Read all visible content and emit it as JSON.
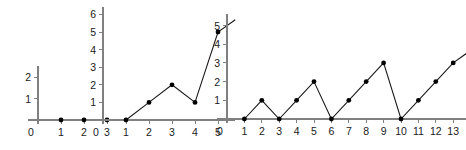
{
  "figure": {
    "background_color": "#ffffff",
    "axis_color": "#808080",
    "line_color": "#1a1a1a",
    "point_color": "#000000",
    "panel_count": 3
  },
  "chart_data": [
    {
      "type": "line",
      "name": "panel-1",
      "title": "",
      "xlabel": "",
      "ylabel": "",
      "x": [
        1,
        2,
        3
      ],
      "values": [
        0,
        0,
        0
      ],
      "xticks": [
        0,
        1,
        2,
        3
      ],
      "xtick_labels": [
        "0",
        "1",
        "2",
        "3"
      ],
      "yticks": [
        0,
        1,
        2
      ],
      "ytick_labels": [
        "0",
        "1",
        "2"
      ],
      "xlim": [
        0,
        3.6
      ],
      "ylim": [
        0,
        2.5
      ],
      "grid": false,
      "legend": "none",
      "markers": true,
      "line_visible": true,
      "open_ended": false
    },
    {
      "type": "line",
      "name": "panel-2",
      "title": "",
      "xlabel": "",
      "ylabel": "",
      "x": [
        1,
        2,
        3,
        4,
        5
      ],
      "values": [
        0,
        1,
        2,
        1,
        5
      ],
      "xticks": [
        0,
        1,
        2,
        3,
        4,
        5
      ],
      "xtick_labels": [
        "0",
        "1",
        "2",
        "3",
        "4",
        "5"
      ],
      "yticks": [
        0,
        1,
        2,
        3,
        4,
        5,
        6
      ],
      "ytick_labels": [
        "0",
        "1",
        "2",
        "3",
        "4",
        "5",
        "6"
      ],
      "xlim": [
        0,
        5.75
      ],
      "ylim": [
        0,
        6.4
      ],
      "grid": false,
      "legend": "none",
      "markers": true,
      "line_visible": true,
      "open_ended": true,
      "open_end_point": [
        5.75,
        5.7
      ]
    },
    {
      "type": "line",
      "name": "panel-3",
      "title": "",
      "xlabel": "",
      "ylabel": "",
      "x": [
        1,
        2,
        3,
        4,
        5,
        6,
        7,
        8,
        9,
        10,
        11,
        12,
        13
      ],
      "values": [
        0,
        1,
        0,
        1,
        2,
        0,
        1,
        2,
        3,
        0,
        1,
        2,
        3
      ],
      "xticks": [
        0,
        1,
        2,
        3,
        4,
        5,
        6,
        7,
        8,
        9,
        10,
        11,
        12,
        13
      ],
      "xtick_labels": [
        "0",
        "1",
        "2",
        "3",
        "4",
        "5",
        "6",
        "7",
        "8",
        "9",
        "10",
        "11",
        "12",
        "13"
      ],
      "yticks": [
        0,
        1,
        2,
        3,
        4,
        5
      ],
      "ytick_labels": [
        "0",
        "1",
        "2",
        "3",
        "4",
        "5"
      ],
      "xlim": [
        0,
        13.75
      ],
      "ylim": [
        0,
        5.6
      ],
      "grid": false,
      "legend": "none",
      "markers": true,
      "line_visible": true,
      "open_ended": true,
      "open_end_point": [
        13.75,
        3.5
      ]
    }
  ]
}
